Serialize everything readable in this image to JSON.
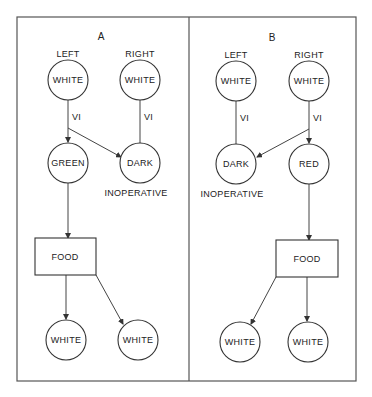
{
  "panels": [
    {
      "id": "A",
      "title": "A",
      "eye_labels": {
        "left": "LEFT",
        "right": "RIGHT"
      },
      "top_nodes": {
        "left": "WHITE",
        "right": "WHITE"
      },
      "edge_labels": {
        "left": "VI",
        "right": "VI"
      },
      "middle_nodes": {
        "left": "GREEN",
        "right": "DARK"
      },
      "status_note": "INOPERATIVE",
      "box": "FOOD",
      "bottom_nodes": {
        "left": "WHITE",
        "right": "WHITE"
      }
    },
    {
      "id": "B",
      "title": "B",
      "eye_labels": {
        "left": "LEFT",
        "right": "RIGHT"
      },
      "top_nodes": {
        "left": "WHITE",
        "right": "WHITE"
      },
      "edge_labels": {
        "left": "VI",
        "right": "VI"
      },
      "middle_nodes": {
        "left": "DARK",
        "right": "RED"
      },
      "status_note": "INOPERATIVE",
      "box": "FOOD",
      "bottom_nodes": {
        "left": "WHITE",
        "right": "WHITE"
      }
    }
  ]
}
